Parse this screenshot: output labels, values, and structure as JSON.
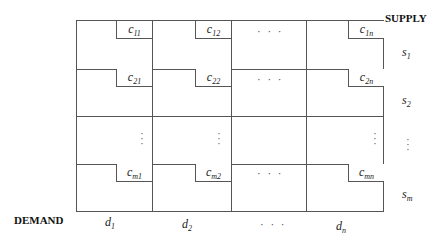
{
  "headers": {
    "supply": "SUPPLY",
    "demand": "DEMAND"
  },
  "costs": {
    "r1": [
      {
        "base": "c",
        "sub": "11"
      },
      {
        "base": "c",
        "sub": "12"
      },
      {
        "base": "c",
        "sub": "1n"
      }
    ],
    "r2": [
      {
        "base": "c",
        "sub": "21"
      },
      {
        "base": "c",
        "sub": "22"
      },
      {
        "base": "c",
        "sub": "2n"
      }
    ],
    "rm": [
      {
        "base": "c",
        "sub": "m1"
      },
      {
        "base": "c",
        "sub": "m2"
      },
      {
        "base": "c",
        "sub": "mn"
      }
    ]
  },
  "supply": [
    {
      "base": "s",
      "sub": "1"
    },
    {
      "base": "s",
      "sub": "2"
    },
    {
      "base": "s",
      "sub": "m"
    }
  ],
  "demand": [
    {
      "base": "d",
      "sub": "1"
    },
    {
      "base": "d",
      "sub": "2"
    },
    {
      "base": "d",
      "sub": "n"
    }
  ],
  "ellipsis": {
    "h": "· · ·",
    "v": "⋮"
  }
}
